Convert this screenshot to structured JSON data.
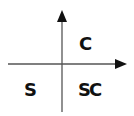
{
  "diagram": {
    "type": "quadrant-axes",
    "axes": {
      "horizontal": {
        "direction": "right",
        "arrow": true
      },
      "vertical": {
        "direction": "up",
        "arrow": true
      }
    },
    "quadrant_labels": {
      "upper_right": "C",
      "lower_left": "S",
      "lower_right": "SC"
    },
    "colors": {
      "axis": "#555555",
      "arrowhead": "#111111",
      "text": "#111111",
      "background": "#ffffff"
    }
  }
}
